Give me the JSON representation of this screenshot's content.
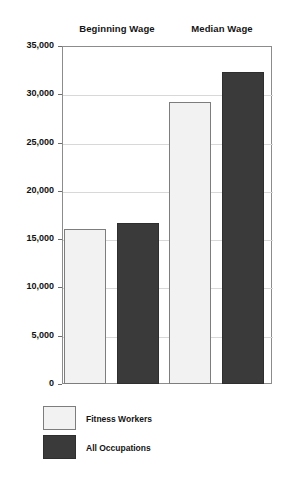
{
  "chart_data": {
    "type": "bar",
    "title": "",
    "subtitle": "",
    "xlabel": "",
    "ylabel": "",
    "categories": [
      "Beginning Wage",
      "Median Wage"
    ],
    "series": [
      {
        "name": "Fitness Workers",
        "color": "#f2f2f2",
        "values": [
          16000,
          29200
        ]
      },
      {
        "name": "All Occupations",
        "color": "#3a3a3a",
        "values": [
          16700,
          32300
        ]
      }
    ],
    "ylim": [
      0,
      35000
    ],
    "ytick_values": [
      0,
      5000,
      10000,
      15000,
      20000,
      25000,
      30000,
      35000
    ],
    "ytick_labels": [
      "0",
      "5,000",
      "10,000",
      "15,000",
      "20,000",
      "25,000",
      "30,000",
      "35,000"
    ],
    "grid": true,
    "legend_position": "bottom-left",
    "annotations": []
  },
  "legend": {
    "items": [
      {
        "label": "Fitness Workers",
        "swatch": "light-swatch"
      },
      {
        "label": "All Occupations",
        "swatch": "dark-swatch"
      }
    ]
  }
}
